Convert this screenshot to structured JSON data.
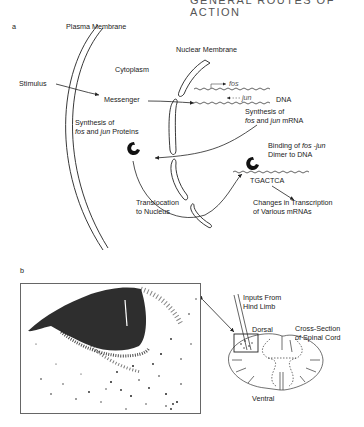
{
  "header": {
    "running_title": "GENERAL ROUTES OF ACTION"
  },
  "panel_a": {
    "label": "a",
    "plasma_membrane": "Plasma Membrane",
    "nuclear_membrane": "Nuclear Membrane",
    "cytoplasm": "Cytoplasm",
    "stimulus": "Stimulus",
    "messenger": "Messenger",
    "fos_gene": "fos",
    "jun_gene": "jun",
    "dna": "DNA",
    "protein_synthesis_line1": "Synthesis of",
    "protein_synthesis_line2_italic_a": "fos",
    "protein_synthesis_line2_mid": " and ",
    "protein_synthesis_line2_italic_b": "jun",
    "protein_synthesis_line2_end": " Proteins",
    "mrna_synthesis_line1": "Synthesis of",
    "mrna_synthesis_line2_italic_a": "fos",
    "mrna_synthesis_line2_mid": " and ",
    "mrna_synthesis_line2_italic_b": "jun",
    "mrna_synthesis_line2_end": " mRNA",
    "binding_line1_start": "Binding of ",
    "binding_line1_italic": "fos -jun",
    "binding_line2": "Dimer to DNA",
    "consensus_sequence": "TGACTCA",
    "changes_line1": "Changes in Transcription",
    "changes_line2": "of Various mRNAs",
    "translocation_line1": "Translocation",
    "translocation_line2": "to Nucleus"
  },
  "panel_b": {
    "label": "b",
    "inputs_line1": "Inputs From",
    "inputs_line2": "Hind Limb",
    "dorsal": "Dorsal",
    "ventral": "Ventral",
    "cross_section_line1": "Cross-Section",
    "cross_section_line2": "of Spinal Cord"
  }
}
